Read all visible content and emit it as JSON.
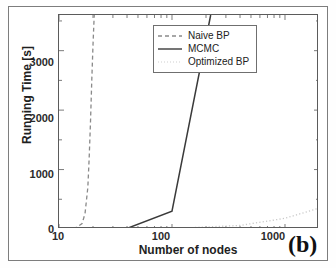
{
  "figure": {
    "panel_label": "(b)"
  },
  "chart_data": {
    "type": "line",
    "title": "",
    "xlabel": "Number of nodes",
    "ylabel": "Running Time [s]",
    "xscale": "log",
    "yscale": "linear",
    "xlim": [
      10,
      2000
    ],
    "ylim": [
      0,
      3600
    ],
    "xticks": [
      10,
      100,
      1000
    ],
    "xticklabels": [
      "10",
      "100",
      "1000"
    ],
    "yticks": [
      0,
      1000,
      2000,
      3000
    ],
    "yticklabels": [
      "0",
      "1000",
      "2000",
      "3000"
    ],
    "grid": false,
    "legend_position": "upper right",
    "series": [
      {
        "name": "Naive BP",
        "style": "dashed",
        "color": "#8a8a8a",
        "x": [
          10,
          14,
          16,
          17,
          18,
          18.5,
          19,
          19.5,
          20,
          20.5
        ],
        "y": [
          0,
          20,
          90,
          260,
          700,
          1200,
          1800,
          2500,
          3100,
          3600
        ]
      },
      {
        "name": "MCMC",
        "style": "solid",
        "color": "#3a3a3a",
        "x": [
          10,
          20,
          40,
          100,
          220
        ],
        "y": [
          2,
          4,
          10,
          300,
          3600
        ]
      },
      {
        "name": "Optimized BP",
        "style": "dotted",
        "color": "#c9c9c9",
        "x": [
          10,
          100,
          400,
          1000,
          2000
        ],
        "y": [
          1,
          8,
          60,
          180,
          350
        ]
      }
    ]
  },
  "legend": {
    "entries": [
      {
        "label": "Naive BP"
      },
      {
        "label": "MCMC"
      },
      {
        "label": "Optimized BP"
      }
    ]
  }
}
